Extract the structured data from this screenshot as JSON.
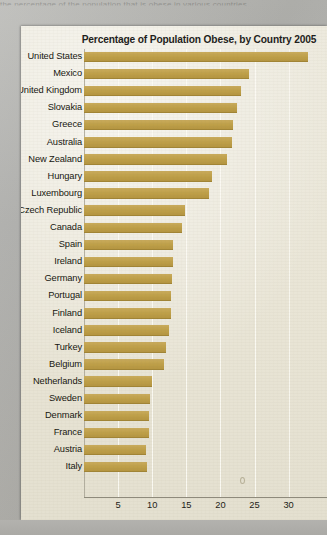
{
  "page": {
    "top_text_bleed": "the percentage of the population that is obese in various countries",
    "background_color": "#b2b2af",
    "panel_color": "#ece8d8"
  },
  "chart_data": {
    "type": "bar",
    "orientation": "horizontal",
    "title": "Percentage of Population Obese, by Country 2005",
    "xlabel": "",
    "ylabel": "",
    "xlim": [
      0,
      33.5
    ],
    "ylim": null,
    "grid": true,
    "legend": null,
    "bar_color": "#bfa049",
    "xticks": [
      5,
      10,
      15,
      20,
      25,
      30
    ],
    "xtick_labels": [
      "5",
      "10",
      "15",
      "20",
      "25",
      "30"
    ],
    "categories": [
      "United States",
      "Mexico",
      "United Kingdom",
      "Slovakia",
      "Greece",
      "Australia",
      "New Zealand",
      "Hungary",
      "Luxembourg",
      "Czech Republic",
      "Canada",
      "Spain",
      "Ireland",
      "Germany",
      "Portugal",
      "Finland",
      "Iceland",
      "Turkey",
      "Belgium",
      "Netherlands",
      "Sweden",
      "Denmark",
      "France",
      "Austria",
      "Italy"
    ],
    "values": [
      32.8,
      24.2,
      23.0,
      22.4,
      21.9,
      21.7,
      20.9,
      18.8,
      18.4,
      14.8,
      14.3,
      13.1,
      13.0,
      12.9,
      12.8,
      12.8,
      12.4,
      12.0,
      11.7,
      10.0,
      9.7,
      9.5,
      9.5,
      9.1,
      9.3
    ]
  }
}
